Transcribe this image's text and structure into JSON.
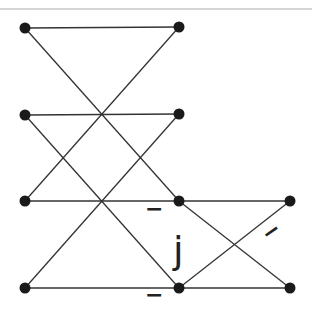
{
  "diagram": {
    "type": "butterfly",
    "colors": {
      "line": "#333333",
      "node": "#1a1a1a",
      "rule": "#999999"
    },
    "nodes": [
      {
        "id": "a0",
        "x": 25,
        "y": 28
      },
      {
        "id": "a1",
        "x": 25,
        "y": 115
      },
      {
        "id": "a2",
        "x": 25,
        "y": 201
      },
      {
        "id": "a3",
        "x": 25,
        "y": 288
      },
      {
        "id": "b0",
        "x": 179,
        "y": 27
      },
      {
        "id": "b1",
        "x": 179,
        "y": 114
      },
      {
        "id": "b2",
        "x": 179,
        "y": 201
      },
      {
        "id": "b3",
        "x": 179,
        "y": 288
      },
      {
        "id": "c2",
        "x": 290,
        "y": 201
      },
      {
        "id": "c3",
        "x": 290,
        "y": 288
      }
    ],
    "edges": [
      [
        "a0",
        "b0"
      ],
      [
        "a0",
        "b2"
      ],
      [
        "a1",
        "b1"
      ],
      [
        "a1",
        "b3"
      ],
      [
        "a2",
        "b0"
      ],
      [
        "a2",
        "b2"
      ],
      [
        "a3",
        "b1"
      ],
      [
        "a3",
        "b3"
      ],
      [
        "b2",
        "c2"
      ],
      [
        "b2",
        "c3"
      ],
      [
        "b3",
        "c2"
      ],
      [
        "b3",
        "c3"
      ]
    ],
    "labels": {
      "minus_upper": "−",
      "j": "j",
      "minus_diag": "−",
      "minus_lower": "−"
    }
  }
}
